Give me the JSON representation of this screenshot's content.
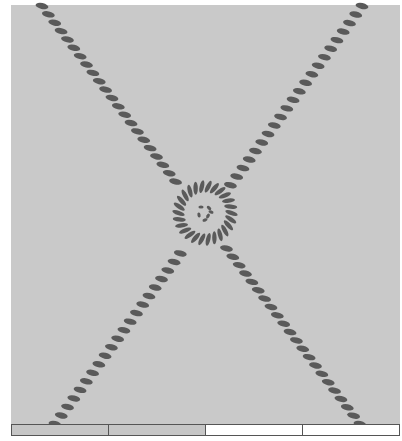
{
  "figure": {
    "background_color": "#c9c9c9",
    "bead_color": "#5a5a5a",
    "center": [
      205,
      213
    ],
    "ring": {
      "outer_radius": 33,
      "inner_radius": 20,
      "bead_count": 26
    },
    "chains": [
      {
        "name": "chain-a",
        "from": [
          42,
          6
        ],
        "to": [
          360,
          424
        ]
      },
      {
        "name": "chain-b",
        "from": [
          362,
          6
        ],
        "to": [
          55,
          424
        ]
      }
    ]
  },
  "scale_bar": {
    "segments": [
      {
        "fill": "#c6c6c6"
      },
      {
        "fill": "#c6c6c6"
      },
      {
        "fill": "#ffffff"
      },
      {
        "fill": "#ffffff"
      }
    ]
  }
}
